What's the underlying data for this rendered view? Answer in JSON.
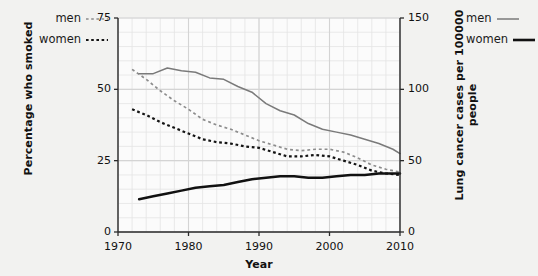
{
  "chart_data": {
    "type": "line",
    "title": "",
    "xlabel": "Year",
    "ylabel": "Percentage who smoked",
    "ylabel_right": "Lung cancer cases per 100000 people",
    "xlim": [
      1970,
      2010
    ],
    "ylim": [
      0,
      75
    ],
    "ylim_right": [
      0,
      150
    ],
    "xticks": [
      1970,
      1980,
      1990,
      2000,
      2010
    ],
    "yticks_left": [
      0,
      25,
      50,
      75
    ],
    "yticks_right": [
      0,
      50,
      100,
      150
    ],
    "grid": true,
    "grid_minor": true,
    "legend_left_position": "outside-top-left",
    "legend_right_position": "outside-top-right",
    "series": [
      {
        "name": "men smoked",
        "axis": "left",
        "style": "dashed",
        "color": "#8c8c8c",
        "legend_group": "left",
        "x": [
          1972,
          1974,
          1976,
          1978,
          1980,
          1982,
          1984,
          1986,
          1988,
          1990,
          1992,
          1994,
          1996,
          1998,
          2000,
          2002,
          2004,
          2006,
          2008,
          2010
        ],
        "values": [
          57,
          53.5,
          49.5,
          46,
          43,
          39.5,
          37.5,
          36,
          34,
          32,
          30.5,
          29,
          28.5,
          29,
          29,
          28,
          26,
          23.5,
          22,
          21
        ]
      },
      {
        "name": "women smoked",
        "axis": "left",
        "style": "dotted",
        "color": "#141414",
        "legend_group": "left",
        "x": [
          1972,
          1974,
          1976,
          1978,
          1980,
          1982,
          1984,
          1986,
          1988,
          1990,
          1992,
          1994,
          1996,
          1998,
          2000,
          2002,
          2004,
          2006,
          2008,
          2010
        ],
        "values": [
          43,
          41,
          38.5,
          36.5,
          34.5,
          32.5,
          31.5,
          31,
          30,
          29.5,
          28,
          26.5,
          26.5,
          27,
          26.5,
          25,
          23.5,
          21.5,
          20.5,
          20
        ]
      },
      {
        "name": "men lung cancer",
        "axis": "right",
        "style": "solid",
        "color": "#7a7a7a",
        "legend_group": "right",
        "x": [
          1973,
          1975,
          1977,
          1979,
          1981,
          1983,
          1985,
          1987,
          1989,
          1991,
          1993,
          1995,
          1997,
          1999,
          2001,
          2003,
          2005,
          2007,
          2009,
          2010
        ],
        "values": [
          111,
          111,
          115,
          113,
          112,
          108,
          107,
          102,
          98,
          90,
          85,
          82,
          76,
          72,
          70,
          68,
          65,
          62,
          58,
          55
        ]
      },
      {
        "name": "women lung cancer",
        "axis": "right",
        "style": "solid",
        "color": "#111111",
        "legend_group": "right",
        "x": [
          1973,
          1975,
          1977,
          1979,
          1981,
          1983,
          1985,
          1987,
          1989,
          1991,
          1993,
          1995,
          1997,
          1999,
          2001,
          2003,
          2005,
          2007,
          2009,
          2010
        ],
        "values": [
          23,
          25,
          27,
          29,
          31,
          32,
          33,
          35,
          37,
          38,
          39,
          39,
          38,
          38,
          39,
          40,
          40,
          41,
          41,
          41
        ]
      }
    ]
  },
  "legend_left": {
    "items": [
      {
        "label": "men",
        "swatch": "dashed-gray-line"
      },
      {
        "label": "women",
        "swatch": "dotted-black-line"
      }
    ]
  },
  "legend_right": {
    "items": [
      {
        "label": "men",
        "swatch": "solid-gray-line"
      },
      {
        "label": "women",
        "swatch": "solid-black-line"
      }
    ]
  },
  "axes": {
    "x_title": "Year",
    "y_left_title": "Percentage who smoked",
    "y_right_title": "Lung cancer cases per 100000 people",
    "x_ticks": [
      "1970",
      "1980",
      "1990",
      "2000",
      "2010"
    ],
    "y_left_ticks": [
      "75",
      "50",
      "25",
      "0"
    ],
    "y_right_ticks": [
      "150",
      "100",
      "50",
      "0"
    ]
  },
  "colors": {
    "background": "#f2f2f0",
    "plot_background": "#fbfbfb",
    "grid_minor": "#e4e4e4",
    "grid_major": "#d4d4d4",
    "axis": "#2b2b2b",
    "men_smoked": "#8c8c8c",
    "women_smoked": "#141414",
    "men_cancer": "#7a7a7a",
    "women_cancer": "#111111"
  }
}
